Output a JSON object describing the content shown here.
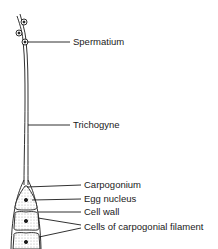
{
  "diagram": {
    "type": "biological-illustration",
    "labels": [
      {
        "id": "spermatium",
        "text": "Spermatium"
      },
      {
        "id": "trichogyne",
        "text": "Trichogyne"
      },
      {
        "id": "carpogonium",
        "text": "Carpogonium"
      },
      {
        "id": "egg-nucleus",
        "text": "Egg nucleus"
      },
      {
        "id": "cell-wall",
        "text": "Cell wall"
      },
      {
        "id": "carpogonial-filament",
        "text": "Cells of carpogonial filament"
      }
    ],
    "colors": {
      "line": "#1a1a1a",
      "stipple": "#bbbbbb",
      "background": "#ffffff"
    }
  }
}
